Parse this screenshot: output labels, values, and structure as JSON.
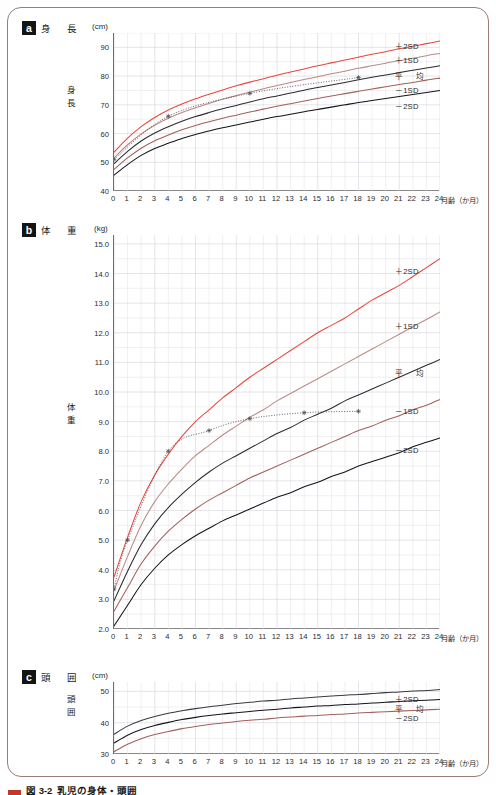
{
  "figure": {
    "caption_label": "図 3-2",
    "caption_text": "乳児の身体・頭囲"
  },
  "panels": [
    {
      "id": "a",
      "badge": "a",
      "title": "身　長",
      "unit": "(cm)",
      "axis_name": "身長",
      "y_ticks": [
        "90",
        "80",
        "70",
        "60",
        "50",
        "40"
      ],
      "x_ticks": [
        "0",
        "1",
        "2",
        "3",
        "4",
        "5",
        "6",
        "7",
        "8",
        "9",
        "10",
        "11",
        "12",
        "13",
        "14",
        "15",
        "16",
        "17",
        "18",
        "19",
        "20",
        "21",
        "22",
        "23",
        "24"
      ],
      "x_caption": "月齢（か月）",
      "legend": [
        "＋2SD",
        "＋1SD",
        "平　均",
        "－1SD",
        "－2SD"
      ]
    },
    {
      "id": "b",
      "badge": "b",
      "title": "体　重",
      "unit": "(kg)",
      "axis_name": "体重",
      "y_ticks": [
        "15.0",
        "14.0",
        "13.0",
        "12.0",
        "11.0",
        "10.0",
        "9.0",
        "8.0",
        "7.0",
        "6.0",
        "5.0",
        "4.0",
        "3.0",
        "2.0"
      ],
      "x_ticks": [
        "0",
        "1",
        "2",
        "3",
        "4",
        "5",
        "6",
        "7",
        "8",
        "9",
        "10",
        "11",
        "12",
        "13",
        "14",
        "15",
        "16",
        "17",
        "18",
        "19",
        "20",
        "21",
        "22",
        "23",
        "24"
      ],
      "x_caption": "月齢（か月）",
      "legend": [
        "＋2SD",
        "＋1SD",
        "平　均",
        "－1SD",
        "－2SD"
      ]
    },
    {
      "id": "c",
      "badge": "c",
      "title": "頭　囲",
      "unit": "(cm)",
      "axis_name": "頭囲",
      "y_ticks": [
        "50",
        "40",
        "30"
      ],
      "x_ticks": [
        "0",
        "1",
        "2",
        "3",
        "4",
        "5",
        "6",
        "7",
        "8",
        "9",
        "10",
        "11",
        "12",
        "13",
        "14",
        "15",
        "16",
        "17",
        "18",
        "19",
        "20",
        "21",
        "22",
        "23",
        "24"
      ],
      "x_caption": "月齢（か月）",
      "legend": [
        "＋2SD",
        "平　均",
        "－2SD"
      ]
    }
  ],
  "colors": {
    "plus2sd": "#e8473c",
    "plus1sd": "#bb8a85",
    "mean": "#2b2b33",
    "minus1sd": "#a2605c",
    "minus2sd": "#14141c",
    "frame": "#9c7a77",
    "grid_minor": "#e3e3e8",
    "grid_major": "#cfcfd6",
    "patient_line": "#4a4a52"
  },
  "chart_data": [
    {
      "type": "line",
      "title": "身長",
      "xlabel": "月齢（か月）",
      "ylabel": "身長",
      "yunit": "cm",
      "xlim": [
        0,
        24
      ],
      "ylim": [
        40,
        95
      ],
      "grid": true,
      "legend_position": "right-inline",
      "x": [
        0,
        1,
        2,
        3,
        4,
        5,
        6,
        7,
        8,
        9,
        10,
        11,
        12,
        13,
        14,
        15,
        16,
        17,
        18,
        19,
        20,
        21,
        22,
        23,
        24
      ],
      "series": [
        {
          "name": "＋2SD",
          "color": "#e8473c",
          "values": [
            53.5,
            58.4,
            62.4,
            65.6,
            68.2,
            70.3,
            72.1,
            73.7,
            75.2,
            76.6,
            77.9,
            79.1,
            80.3,
            81.4,
            82.5,
            83.6,
            84.6,
            85.6,
            86.6,
            87.6,
            88.5,
            89.5,
            90.4,
            91.3,
            92.2
          ]
        },
        {
          "name": "＋1SD",
          "color": "#bb8a85",
          "values": [
            51.5,
            56.1,
            59.9,
            62.9,
            65.3,
            67.3,
            69.0,
            70.5,
            71.9,
            73.2,
            74.4,
            75.6,
            76.7,
            77.8,
            78.8,
            79.8,
            80.8,
            81.7,
            82.7,
            83.6,
            84.5,
            85.4,
            86.2,
            87.1,
            87.9
          ]
        },
        {
          "name": "平　均",
          "color": "#2b2b33",
          "values": [
            49.5,
            53.8,
            57.4,
            60.2,
            62.4,
            64.3,
            65.9,
            67.3,
            68.6,
            69.8,
            71.0,
            72.1,
            73.1,
            74.1,
            75.1,
            76.0,
            76.9,
            77.8,
            78.7,
            79.6,
            80.4,
            81.2,
            82.0,
            82.8,
            83.6
          ]
        },
        {
          "name": "－1SD",
          "color": "#a2605c",
          "values": [
            47.5,
            51.5,
            54.9,
            57.5,
            59.5,
            61.3,
            62.8,
            64.1,
            65.3,
            66.4,
            67.5,
            68.5,
            69.5,
            70.4,
            71.3,
            72.2,
            73.1,
            73.9,
            74.7,
            75.5,
            76.3,
            77.1,
            77.8,
            78.6,
            79.3
          ]
        },
        {
          "name": "－2SD",
          "color": "#14141c",
          "values": [
            45.5,
            49.2,
            52.4,
            54.8,
            56.6,
            58.3,
            59.7,
            60.9,
            62.0,
            63.0,
            64.0,
            65.0,
            65.9,
            66.7,
            67.6,
            68.4,
            69.2,
            70.0,
            70.8,
            71.5,
            72.2,
            72.9,
            73.6,
            74.3,
            75.0
          ]
        }
      ],
      "patient_series": {
        "name": "測定値",
        "style": "dotted",
        "marker": "asterisk",
        "x": [
          0,
          4,
          10,
          18
        ],
        "values": [
          51.0,
          66.0,
          74.0,
          79.5
        ]
      }
    },
    {
      "type": "line",
      "title": "体重",
      "xlabel": "月齢（か月）",
      "ylabel": "体重",
      "yunit": "kg",
      "xlim": [
        0,
        24
      ],
      "ylim": [
        2.0,
        15.3
      ],
      "grid": true,
      "legend_position": "right-inline",
      "x": [
        0,
        1,
        2,
        3,
        4,
        5,
        6,
        7,
        8,
        9,
        10,
        11,
        12,
        13,
        14,
        15,
        16,
        17,
        18,
        19,
        20,
        21,
        22,
        23,
        24
      ],
      "series": [
        {
          "name": "＋2SD",
          "color": "#e8473c",
          "values": [
            3.75,
            5.1,
            6.3,
            7.2,
            7.9,
            8.5,
            9.0,
            9.4,
            9.8,
            10.15,
            10.5,
            10.8,
            11.1,
            11.4,
            11.7,
            12.0,
            12.25,
            12.5,
            12.8,
            13.1,
            13.35,
            13.6,
            13.9,
            14.2,
            14.5
          ]
        },
        {
          "name": "＋1SD",
          "color": "#bb8a85",
          "values": [
            3.3,
            4.45,
            5.5,
            6.3,
            6.9,
            7.4,
            7.85,
            8.2,
            8.55,
            8.85,
            9.15,
            9.4,
            9.7,
            9.95,
            10.2,
            10.45,
            10.7,
            10.95,
            11.2,
            11.45,
            11.7,
            11.95,
            12.2,
            12.45,
            12.7
          ]
        },
        {
          "name": "平　均",
          "color": "#2b2b33",
          "values": [
            2.95,
            3.95,
            4.85,
            5.55,
            6.1,
            6.55,
            6.95,
            7.3,
            7.6,
            7.85,
            8.1,
            8.35,
            8.6,
            8.8,
            9.05,
            9.25,
            9.45,
            9.7,
            9.9,
            10.1,
            10.3,
            10.5,
            10.7,
            10.9,
            11.1
          ]
        },
        {
          "name": "－1SD",
          "color": "#a2605c",
          "values": [
            2.6,
            3.4,
            4.2,
            4.8,
            5.3,
            5.7,
            6.05,
            6.35,
            6.6,
            6.85,
            7.1,
            7.3,
            7.5,
            7.7,
            7.9,
            8.1,
            8.3,
            8.5,
            8.7,
            8.85,
            9.05,
            9.2,
            9.4,
            9.55,
            9.75
          ]
        },
        {
          "name": "－2SD",
          "color": "#14141c",
          "values": [
            2.1,
            2.8,
            3.5,
            4.05,
            4.5,
            4.85,
            5.15,
            5.4,
            5.65,
            5.85,
            6.05,
            6.25,
            6.45,
            6.6,
            6.8,
            6.95,
            7.15,
            7.3,
            7.5,
            7.65,
            7.8,
            7.95,
            8.15,
            8.3,
            8.45
          ]
        }
      ],
      "patient_series": {
        "name": "測定値",
        "style": "dotted",
        "marker": "asterisk",
        "x": [
          0,
          1,
          4,
          7,
          10,
          14,
          18
        ],
        "values": [
          3.35,
          5.0,
          8.0,
          8.7,
          9.1,
          9.3,
          9.35
        ]
      }
    },
    {
      "type": "line",
      "title": "頭囲",
      "xlabel": "月齢（か月）",
      "ylabel": "頭囲",
      "yunit": "cm",
      "xlim": [
        0,
        24
      ],
      "ylim": [
        30,
        53
      ],
      "grid": true,
      "legend_position": "right-inline",
      "x": [
        0,
        1,
        2,
        3,
        4,
        5,
        6,
        7,
        8,
        9,
        10,
        11,
        12,
        13,
        14,
        15,
        16,
        17,
        18,
        19,
        20,
        21,
        22,
        23,
        24
      ],
      "series": [
        {
          "name": "＋2SD",
          "color": "#3a3a42",
          "values": [
            36.3,
            38.9,
            40.7,
            42.0,
            43.0,
            43.8,
            44.5,
            45.1,
            45.6,
            46.1,
            46.5,
            46.9,
            47.2,
            47.6,
            47.9,
            48.2,
            48.5,
            48.8,
            49.0,
            49.3,
            49.6,
            49.8,
            50.1,
            50.3,
            50.6
          ]
        },
        {
          "name": "平　均",
          "color": "#14141c",
          "values": [
            33.5,
            36.0,
            37.8,
            39.1,
            40.1,
            41.0,
            41.7,
            42.3,
            42.8,
            43.2,
            43.6,
            44.0,
            44.3,
            44.7,
            45.0,
            45.3,
            45.5,
            45.8,
            46.0,
            46.3,
            46.5,
            46.8,
            47.0,
            47.2,
            47.4
          ]
        },
        {
          "name": "－2SD",
          "color": "#a2605c",
          "values": [
            30.7,
            33.1,
            34.9,
            36.2,
            37.2,
            38.1,
            38.8,
            39.4,
            39.9,
            40.4,
            40.8,
            41.1,
            41.5,
            41.8,
            42.1,
            42.3,
            42.6,
            42.8,
            43.1,
            43.3,
            43.5,
            43.7,
            43.9,
            44.1,
            44.3
          ]
        }
      ]
    }
  ]
}
